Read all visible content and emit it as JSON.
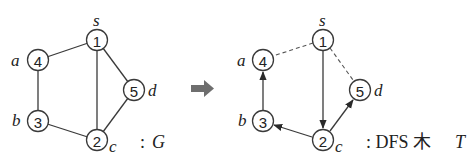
{
  "graph_g": {
    "caption_prefix": ":",
    "caption_symbol": "G",
    "nodes": [
      {
        "id": "1",
        "label": "s"
      },
      {
        "id": "2",
        "label": "c"
      },
      {
        "id": "3",
        "label": "b"
      },
      {
        "id": "4",
        "label": "a"
      },
      {
        "id": "5",
        "label": "d"
      }
    ],
    "edges": [
      [
        "1",
        "4"
      ],
      [
        "1",
        "2"
      ],
      [
        "1",
        "5"
      ],
      [
        "4",
        "3"
      ],
      [
        "3",
        "2"
      ],
      [
        "2",
        "5"
      ]
    ]
  },
  "transform_arrow": {
    "color": "#6e6e6e"
  },
  "dfs_tree": {
    "caption_prefix": ": DFS 木",
    "caption_symbol": "T",
    "nodes": [
      {
        "id": "1",
        "label": "s"
      },
      {
        "id": "2",
        "label": "c"
      },
      {
        "id": "3",
        "label": "b"
      },
      {
        "id": "4",
        "label": "a"
      },
      {
        "id": "5",
        "label": "d"
      }
    ],
    "tree_edges": [
      [
        "1",
        "2"
      ],
      [
        "2",
        "3"
      ],
      [
        "3",
        "4"
      ],
      [
        "2",
        "5"
      ]
    ],
    "back_edges": [
      [
        "1",
        "4"
      ],
      [
        "1",
        "5"
      ]
    ]
  }
}
